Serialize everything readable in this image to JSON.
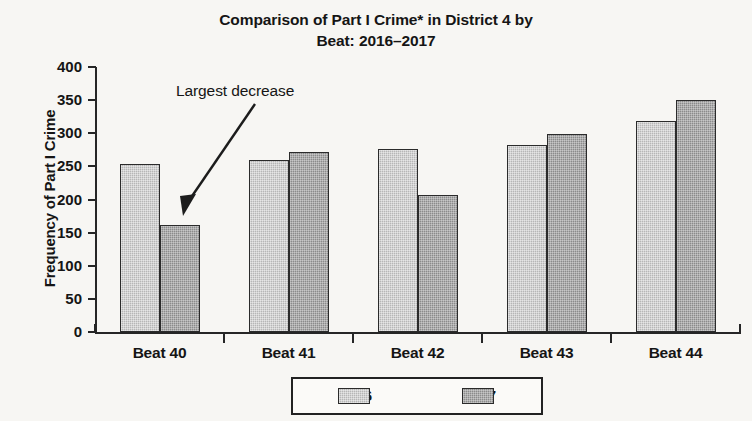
{
  "chart_data": {
    "type": "bar",
    "title": "Comparison of Part I Crime* in District 4 by Beat: 2016–2017",
    "title_line1": "Comparison of Part I Crime* in District 4 by",
    "title_line2": "Beat: 2016–2017",
    "xlabel": "",
    "ylabel": "Frequency of Part I Crime",
    "categories": [
      "Beat 40",
      "Beat 41",
      "Beat 42",
      "Beat 43",
      "Beat 44"
    ],
    "series": [
      {
        "name": "2016",
        "color": "#b6b6b6",
        "values": [
          253,
          260,
          276,
          282,
          319
        ]
      },
      {
        "name": "2017",
        "color": "#8b8b8b",
        "values": [
          162,
          272,
          207,
          299,
          350
        ]
      }
    ],
    "ylim": [
      0,
      400
    ],
    "ytick_step": 50,
    "yticks": [
      400,
      350,
      300,
      250,
      200,
      150,
      100,
      50,
      0
    ],
    "grid": false,
    "legend_position": "bottom",
    "annotations": [
      {
        "text": "Largest decrease",
        "points_to": {
          "category": "Beat 40",
          "series": "2017",
          "value": 162
        }
      }
    ]
  },
  "legend": {
    "items": [
      {
        "label": "2016"
      },
      {
        "label": "2017"
      }
    ]
  }
}
